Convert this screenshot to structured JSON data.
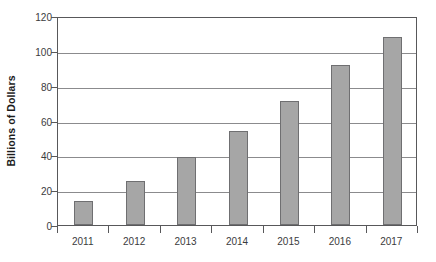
{
  "chart_data": {
    "type": "bar",
    "title": "",
    "xlabel": "",
    "ylabel": "Billions of Dollars",
    "categories": [
      "2011",
      "2012",
      "2013",
      "2014",
      "2015",
      "2016",
      "2017"
    ],
    "values": [
      14,
      25,
      39,
      54,
      71,
      92,
      108
    ],
    "ylim": [
      0,
      120
    ],
    "yticks": [
      "0",
      "20",
      "40",
      "60",
      "80",
      "100",
      "120"
    ],
    "ytick_values": [
      0,
      20,
      40,
      60,
      80,
      100,
      120
    ],
    "grid": "horizontal",
    "legend": "none",
    "bar_color": "#a6a6a6",
    "bar_border_color": "#6f6f71",
    "axis_color": "#58585a",
    "gridline_color": "#8b8b8d",
    "background": "#ffffff"
  }
}
